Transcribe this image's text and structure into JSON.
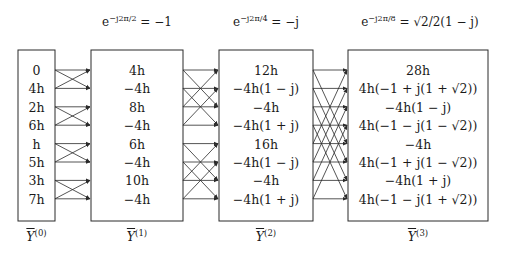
{
  "twiddle_labels": [
    {
      "base": "e",
      "exponent": "−j2π/2",
      "rhs": "= −1"
    },
    {
      "base": "e",
      "exponent": "−j2π/4",
      "rhs": "= −j"
    },
    {
      "base": "e",
      "exponent": "−j2π/8",
      "rhs": "= √2/2(1 − j)"
    }
  ],
  "stages": [
    {
      "name": "Y(0)",
      "vector_label": "Y",
      "superscript": "(0)",
      "values": [
        "0",
        "4h",
        "2h",
        "6h",
        "h",
        "5h",
        "3h",
        "7h"
      ]
    },
    {
      "name": "Y(1)",
      "vector_label": "Y",
      "superscript": "(1)",
      "values": [
        "4h",
        "−4h",
        "8h",
        "−4h",
        "6h",
        "−4h",
        "10h",
        "−4h"
      ]
    },
    {
      "name": "Y(2)",
      "vector_label": "Y",
      "superscript": "(2)",
      "values": [
        "12h",
        "−4h(1 − j)",
        "−4h",
        "−4h(1 + j)",
        "16h",
        "−4h(1 − j)",
        "−4h",
        "−4h(1 + j)"
      ]
    },
    {
      "name": "Y(3)",
      "vector_label": "Y",
      "superscript": "(3)",
      "values": [
        "28h",
        "4h(−1 + j(1 + √2))",
        "−4h(1 − j)",
        "4h(−1 − j(1 − √2))",
        "−4h",
        "4h(−1 + j(1 − √2))",
        "−4h(1 + j)",
        "4h(−1 − j(1 + √2))"
      ]
    }
  ],
  "butterfly_spans": [
    1,
    2,
    4
  ],
  "colors": {
    "line": "#2a2a2a",
    "text": "#1a1a1a",
    "background": "#ffffff"
  }
}
